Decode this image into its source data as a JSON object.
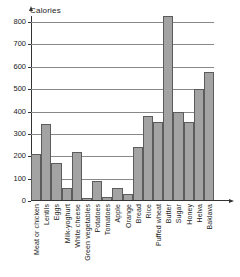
{
  "chart_data": {
    "type": "bar",
    "title": "",
    "ylabel": "Calories",
    "xlabel": "",
    "ylim": [
      0,
      800
    ],
    "yticks": [
      0,
      100,
      200,
      300,
      400,
      500,
      600,
      700,
      800
    ],
    "grid": true,
    "legend": "none",
    "categories": [
      "Meat or chicken",
      "Lentils",
      "Eggs",
      "Milk-yoghurt",
      "White cheese",
      "Green vegetables",
      "Potatoes",
      "Tomatoes",
      "Apple",
      "Orange",
      "Bread",
      "Rice",
      "Puffed wheat",
      "Butter",
      "Sugar",
      "Honey",
      "Helva",
      "Baklava"
    ],
    "values": [
      210,
      345,
      170,
      60,
      220,
      15,
      90,
      20,
      58,
      30,
      240,
      378,
      355,
      828,
      398,
      355,
      500,
      575
    ],
    "bar_color": "#a3a3a3",
    "bar_border_color": "#5c5c5c",
    "axis_color": "#333333",
    "grid_color": "#888888"
  }
}
